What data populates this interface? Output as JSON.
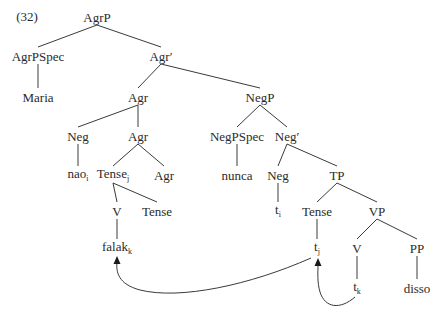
{
  "example_number": "(32)",
  "nodes": {
    "agrp": {
      "label": "AgrP",
      "x": 97,
      "y": 17
    },
    "agrpspec": {
      "label": "AgrPSpec",
      "x": 38,
      "y": 56
    },
    "maria": {
      "label": "Maria",
      "x": 38,
      "y": 97
    },
    "agr_bar": {
      "label": "Agr′",
      "x": 161,
      "y": 56
    },
    "agr_head": {
      "label": "Agr",
      "x": 138,
      "y": 97
    },
    "negp": {
      "label": "NegP",
      "x": 260,
      "y": 97
    },
    "neg_clitic": {
      "label": "Neg",
      "x": 78,
      "y": 136
    },
    "nao": {
      "label": "nao",
      "sub": "i",
      "x": 78,
      "y": 175
    },
    "agr_complex": {
      "label": "Agr",
      "x": 138,
      "y": 136
    },
    "tense_j": {
      "label": "Tense",
      "sub": "j",
      "x": 113,
      "y": 175
    },
    "agr_inner": {
      "label": "Agr",
      "x": 164,
      "y": 175
    },
    "v_upper": {
      "label": "V",
      "x": 117,
      "y": 211
    },
    "tense_inner": {
      "label": "Tense",
      "x": 157,
      "y": 211
    },
    "falak": {
      "label": "falak",
      "sub": "k",
      "x": 117,
      "y": 248
    },
    "negpspec": {
      "label": "NegPSpec",
      "x": 237,
      "y": 136
    },
    "nunca": {
      "label": "nunca",
      "x": 237,
      "y": 175
    },
    "neg_bar": {
      "label": "Neg′",
      "x": 287,
      "y": 136
    },
    "neg_head": {
      "label": "Neg",
      "x": 278,
      "y": 175
    },
    "tp": {
      "label": "TP",
      "x": 337,
      "y": 175
    },
    "t_i": {
      "label": "t",
      "sub": "i",
      "x": 278,
      "y": 211
    },
    "tense_head": {
      "label": "Tense",
      "x": 317,
      "y": 211
    },
    "vp": {
      "label": "VP",
      "x": 377,
      "y": 211
    },
    "t_j": {
      "label": "t",
      "sub": "j",
      "x": 317,
      "y": 248
    },
    "v_lower": {
      "label": "V",
      "x": 357,
      "y": 248
    },
    "pp": {
      "label": "PP",
      "x": 417,
      "y": 248
    },
    "t_k": {
      "label": "t",
      "sub": "k",
      "x": 357,
      "y": 288
    },
    "disso": {
      "label": "disso",
      "x": 417,
      "y": 288
    }
  },
  "edges": [
    [
      "agrp",
      "agrpspec"
    ],
    [
      "agrp",
      "agr_bar"
    ],
    [
      "agrpspec",
      "maria"
    ],
    [
      "agr_bar",
      "agr_head"
    ],
    [
      "agr_bar",
      "negp"
    ],
    [
      "agr_head",
      "neg_clitic"
    ],
    [
      "agr_head",
      "agr_complex"
    ],
    [
      "neg_clitic",
      "nao"
    ],
    [
      "agr_complex",
      "tense_j"
    ],
    [
      "agr_complex",
      "agr_inner"
    ],
    [
      "tense_j",
      "v_upper"
    ],
    [
      "tense_j",
      "tense_inner"
    ],
    [
      "v_upper",
      "falak"
    ],
    [
      "negp",
      "negpspec"
    ],
    [
      "negp",
      "neg_bar"
    ],
    [
      "negpspec",
      "nunca"
    ],
    [
      "neg_bar",
      "neg_head"
    ],
    [
      "neg_bar",
      "tp"
    ],
    [
      "neg_head",
      "t_i"
    ],
    [
      "tp",
      "tense_head"
    ],
    [
      "tp",
      "vp"
    ],
    [
      "tense_head",
      "t_j"
    ],
    [
      "vp",
      "v_lower"
    ],
    [
      "vp",
      "pp"
    ],
    [
      "v_lower",
      "t_k"
    ],
    [
      "pp",
      "disso"
    ]
  ],
  "movement_arrows": [
    {
      "name": "t_j-to-falak",
      "from": "t_j",
      "to": "falak"
    },
    {
      "name": "t_k-to-t_j",
      "from": "t_k",
      "to": "t_j"
    }
  ],
  "colors": {
    "line": "#3a3a3a",
    "text": "#2a2a2a"
  }
}
